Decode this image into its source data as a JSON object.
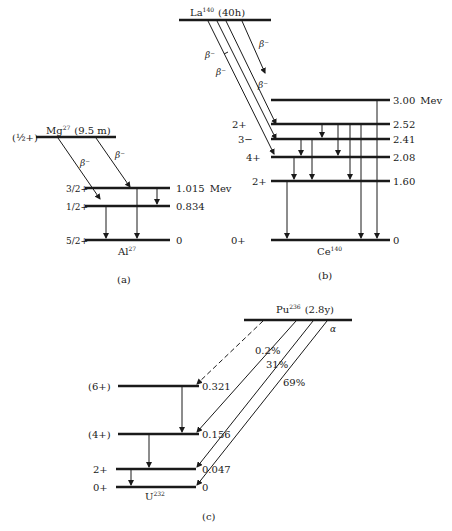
{
  "panel_a": {
    "caption": "(a)",
    "parent": {
      "name": "Mg",
      "mass": "27",
      "halflife": "(9.5 m)",
      "spin": "(½+)"
    },
    "daughter": {
      "name": "Al",
      "mass": "27"
    },
    "levels": [
      {
        "spin": "3/2+",
        "energy": "1.015",
        "unit": "Mev"
      },
      {
        "spin": "1/2+",
        "energy": "0.834"
      },
      {
        "spin": "5/2+",
        "energy": "0"
      }
    ],
    "beta_labels": [
      "β⁻",
      "β⁻"
    ]
  },
  "panel_b": {
    "caption": "(b)",
    "parent": {
      "name": "La",
      "mass": "140",
      "halflife": "(40h)"
    },
    "daughter": {
      "name": "Ce",
      "mass": "140"
    },
    "levels": [
      {
        "spin": "",
        "energy": "3.00",
        "unit": "Mev"
      },
      {
        "spin": "2+",
        "energy": "2.52"
      },
      {
        "spin": "3−",
        "energy": "2.41"
      },
      {
        "spin": "4+",
        "energy": "2.08"
      },
      {
        "spin": "2+",
        "energy": "1.60"
      },
      {
        "spin": "0+",
        "energy": "0"
      }
    ],
    "beta_labels": [
      "β⁻",
      "β⁻",
      "β⁻",
      "β⁻"
    ]
  },
  "panel_c": {
    "caption": "(c)",
    "parent": {
      "name": "Pu",
      "mass": "236",
      "halflife": "(2.8y)"
    },
    "daughter": {
      "name": "U",
      "mass": "232"
    },
    "alpha_label": "α",
    "levels": [
      {
        "spin": "(6+)",
        "energy": "0.321"
      },
      {
        "spin": "(4+)",
        "energy": "0.156"
      },
      {
        "spin": "2+",
        "energy": "0.047"
      },
      {
        "spin": "0+",
        "energy": "0"
      }
    ],
    "branches": [
      "0.2%",
      "31%",
      "69%"
    ]
  }
}
